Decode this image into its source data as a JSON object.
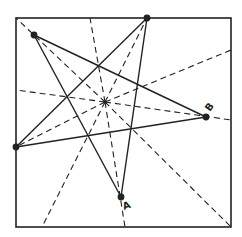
{
  "diagram": {
    "colors": {
      "ink": "#222222",
      "background": "#ffffff"
    },
    "square": {
      "x1": 16,
      "y1": 18,
      "x2": 231,
      "y2": 227
    },
    "center": {
      "x": 105,
      "y": 102
    },
    "points": [
      {
        "id": "P1",
        "x": 34,
        "y": 35,
        "label": ""
      },
      {
        "id": "P2",
        "x": 147,
        "y": 18,
        "label": ""
      },
      {
        "id": "B",
        "x": 206,
        "y": 117,
        "label": "B"
      },
      {
        "id": "P4",
        "x": 16,
        "y": 147,
        "label": ""
      },
      {
        "id": "A",
        "x": 121,
        "y": 197,
        "label": "A"
      }
    ],
    "labels": {
      "a": "A",
      "b": "B"
    },
    "star_edges": [
      [
        "P1",
        "B"
      ],
      [
        "B",
        "P4"
      ],
      [
        "P4",
        "P2"
      ],
      [
        "P2",
        "A"
      ],
      [
        "A",
        "P1"
      ]
    ],
    "dashed_rays": [
      {
        "x2": 16,
        "y2": 18
      },
      {
        "x2": 90,
        "y2": 18
      },
      {
        "x2": 147,
        "y2": 18
      },
      {
        "x2": 231,
        "y2": 50
      },
      {
        "x2": 231,
        "y2": 120
      },
      {
        "x2": 231,
        "y2": 227
      },
      {
        "x2": 125,
        "y2": 227
      },
      {
        "x2": 42,
        "y2": 227
      },
      {
        "x2": 16,
        "y2": 147
      },
      {
        "x2": 16,
        "y2": 90
      }
    ]
  }
}
